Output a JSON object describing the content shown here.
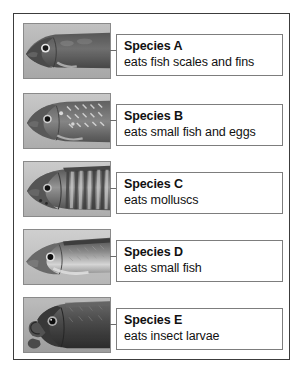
{
  "figure": {
    "caption": "",
    "rows": [
      {
        "photo_name": "fish-photo-species-a",
        "photo_alt": "grayscale photograph of fish head, species A",
        "name": "Species A",
        "diet": "eats fish scales and fins"
      },
      {
        "photo_name": "fish-photo-species-b",
        "photo_alt": "grayscale photograph of fish head, species B",
        "name": "Species B",
        "diet": "eats small fish and eggs"
      },
      {
        "photo_name": "fish-photo-species-c",
        "photo_alt": "grayscale photograph of fish head, species C",
        "name": "Species C",
        "diet": "eats molluscs"
      },
      {
        "photo_name": "fish-photo-species-d",
        "photo_alt": "grayscale photograph of fish head, species D",
        "name": "Species D",
        "diet": "eats small fish"
      },
      {
        "photo_name": "fish-photo-species-e",
        "photo_alt": "grayscale photograph of fish head, species E",
        "name": "Species E",
        "diet": "eats insect larvae"
      }
    ]
  },
  "colors": {
    "frame_border": "#3c3c3c",
    "photo_border": "#8a8a8a",
    "label_border": "#7d7d7d",
    "text": "#111111",
    "page_background": "#ffffff"
  }
}
